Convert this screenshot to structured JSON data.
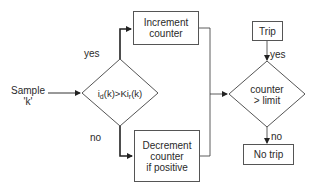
{
  "diagram": {
    "input": {
      "line1": "Sample",
      "line2": "'k'"
    },
    "decision1": {
      "prefix": "i",
      "sub1": "d",
      "mid": "(k)>Ki",
      "sub2": "r",
      "suffix": "(k)"
    },
    "branch_yes": "yes",
    "branch_no": "no",
    "increment_box": {
      "line1": "Increment",
      "line2": "counter"
    },
    "decrement_box": {
      "line1": "Decrement",
      "line2": "counter",
      "line3": "if positive"
    },
    "decision2": {
      "line1": "counter",
      "line2": "> limit"
    },
    "trip_box": "Trip",
    "trip_branch": "yes",
    "no_trip_branch": "no",
    "no_trip_box": "No trip",
    "colors": {
      "line": "#333333",
      "box_border": "#555555",
      "text": "#2a2a2a"
    }
  }
}
